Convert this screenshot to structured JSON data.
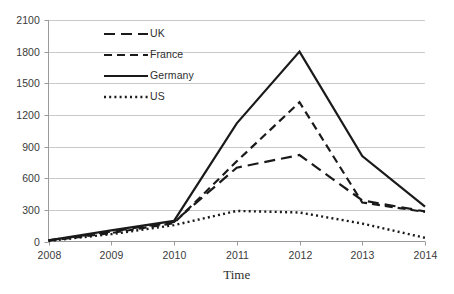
{
  "chart_data": {
    "type": "line",
    "title": "",
    "xlabel": "Time",
    "ylabel": "",
    "categories": [
      "2008",
      "2009",
      "2010",
      "2011",
      "2012",
      "2013",
      "2014"
    ],
    "x": [
      2008,
      2009,
      2010,
      2011,
      2012,
      2013,
      2014
    ],
    "xlim": [
      2008,
      2014
    ],
    "ylim": [
      0,
      2100
    ],
    "y_ticks": [
      "0",
      "300",
      "600",
      "900",
      "1200",
      "1500",
      "1800",
      "2100"
    ],
    "y_tick_values": [
      0,
      300,
      600,
      900,
      1200,
      1500,
      1800,
      2100
    ],
    "y_tick_step": 300,
    "grid": "horizontal",
    "legend_position": "inside-top-left",
    "line_color": "#1a1a1a",
    "gridline_color": "#c9c9c9",
    "axis_color": "#9a9a9a",
    "background": "#ffffff",
    "series": [
      {
        "name": "UK",
        "style": "long-dash",
        "dasharray": "11,6",
        "width": 2.2,
        "values": [
          10,
          95,
          185,
          700,
          820,
          390,
          285
        ]
      },
      {
        "name": "France",
        "style": "medium-dash",
        "dasharray": "8,5",
        "width": 2.2,
        "values": [
          8,
          80,
          175,
          760,
          1320,
          370,
          280
        ]
      },
      {
        "name": "Germany",
        "style": "solid",
        "dasharray": "",
        "width": 2.2,
        "values": [
          12,
          105,
          195,
          1120,
          1800,
          810,
          330
        ]
      },
      {
        "name": "US",
        "style": "dotted",
        "dasharray": "2,3.2",
        "width": 2.4,
        "values": [
          5,
          70,
          155,
          290,
          275,
          170,
          35
        ]
      }
    ]
  },
  "legend": {
    "items": [
      {
        "label": "UK",
        "swatch": "long-dash-swatch"
      },
      {
        "label": "France",
        "swatch": "medium-dash-swatch"
      },
      {
        "label": "Germany",
        "swatch": "solid-line-swatch"
      },
      {
        "label": "US",
        "swatch": "dotted-line-swatch"
      }
    ]
  }
}
